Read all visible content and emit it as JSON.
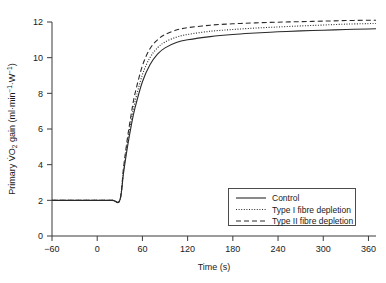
{
  "chart_data": {
    "type": "line",
    "title": "",
    "xlabel": "Time (s)",
    "ylabel": "Primary VO2 gain (ml·min⁻¹·W⁻¹)",
    "ylabel_parts": {
      "prefix": "Primary ",
      "v_dot": "V̇",
      "o": "O",
      "sub2": "2",
      "suffix": " gain (ml·min",
      "exp1": "−1",
      "mid": "·W",
      "exp2": "−1",
      "close": ")"
    },
    "xlim": [
      -60,
      370
    ],
    "ylim": [
      0,
      12
    ],
    "xticks": [
      -60,
      0,
      60,
      120,
      180,
      240,
      300,
      360
    ],
    "xtick_labels": [
      "−60",
      "0",
      "60",
      "120",
      "180",
      "240",
      "300",
      "360"
    ],
    "yticks": [
      0,
      2,
      4,
      6,
      8,
      10,
      12
    ],
    "ytick_labels": [
      "0",
      "2",
      "4",
      "6",
      "8",
      "10",
      "12"
    ],
    "grid": false,
    "baseline_value": 2,
    "onset_time": 30,
    "legend_position": "lower-right",
    "series": [
      {
        "name": "Control",
        "style": "solid",
        "color": "#2a2a2a",
        "amplitude": 9.3,
        "tau": 26,
        "slow_rise": 0.55,
        "plateau": 11.62,
        "x": [
          -60,
          -30,
          0,
          20,
          30,
          35,
          40,
          45,
          50,
          60,
          70,
          80,
          90,
          105,
          120,
          150,
          180,
          210,
          240,
          270,
          300,
          330,
          360,
          370
        ],
        "values": [
          2.0,
          2.0,
          2.0,
          2.0,
          2.0,
          3.55,
          4.95,
          6.15,
          7.15,
          8.65,
          9.6,
          10.2,
          10.55,
          10.85,
          11.0,
          11.18,
          11.3,
          11.38,
          11.45,
          11.5,
          11.54,
          11.58,
          11.61,
          11.62
        ]
      },
      {
        "name": "Type I fibre depletion",
        "style": "dotted",
        "color": "#2a2a2a",
        "amplitude": 9.55,
        "tau": 24,
        "slow_rise": 0.6,
        "plateau": 11.92,
        "x": [
          -60,
          -30,
          0,
          20,
          30,
          35,
          40,
          45,
          50,
          60,
          70,
          80,
          90,
          105,
          120,
          150,
          180,
          210,
          240,
          270,
          300,
          330,
          360,
          370
        ],
        "values": [
          2.0,
          2.0,
          2.0,
          2.0,
          2.0,
          3.7,
          5.2,
          6.45,
          7.5,
          9.05,
          10.0,
          10.55,
          10.88,
          11.15,
          11.3,
          11.48,
          11.58,
          11.66,
          11.72,
          11.78,
          11.83,
          11.88,
          11.91,
          11.92
        ]
      },
      {
        "name": "Type II fibre depletion",
        "style": "dashed",
        "color": "#2a2a2a",
        "amplitude": 9.85,
        "tau": 21,
        "slow_rise": 0.45,
        "plateau": 12.1,
        "x": [
          -60,
          -30,
          0,
          20,
          30,
          35,
          40,
          45,
          50,
          60,
          70,
          80,
          90,
          105,
          120,
          150,
          180,
          210,
          240,
          270,
          300,
          330,
          360,
          370
        ],
        "values": [
          2.0,
          2.0,
          2.0,
          2.0,
          2.0,
          3.85,
          5.45,
          6.8,
          7.95,
          9.55,
          10.5,
          11.0,
          11.3,
          11.55,
          11.68,
          11.82,
          11.9,
          11.95,
          11.99,
          12.02,
          12.05,
          12.08,
          12.1,
          12.1
        ]
      }
    ]
  },
  "legend": {
    "items": [
      {
        "label": "Control",
        "style": "solid"
      },
      {
        "label": "Type I fibre depletion",
        "style": "dotted"
      },
      {
        "label": "Type II fibre depletion",
        "style": "dashed"
      }
    ]
  }
}
